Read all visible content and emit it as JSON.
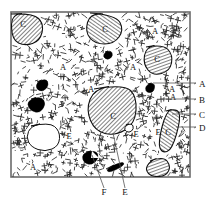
{
  "figure": {
    "kind": "petrographic-sketch",
    "frame": {
      "x": 11,
      "y": 12,
      "width": 179,
      "height": 165,
      "stroke": "#6b6b6b",
      "fill": "#ffffff"
    },
    "colors": {
      "ink": "#111111",
      "frame": "#6b6b6b",
      "hatch": "#1a1a1a",
      "opaque": "#000000",
      "matrix": "#2b2b2b",
      "leader": "#555555"
    }
  },
  "callouts": {
    "right": [
      {
        "key": "A",
        "label": "A",
        "x": 199,
        "y": 87,
        "line_from_x": 190,
        "line_to_x": 153,
        "line_y": 83
      },
      {
        "key": "B",
        "label": "B",
        "x": 199,
        "y": 103,
        "line_from_x": 190,
        "line_to_x": 160,
        "line_y": 99
      },
      {
        "key": "C",
        "label": "C",
        "x": 199,
        "y": 118,
        "line_from_x": 190,
        "line_to_x": 172,
        "line_y": 114
      },
      {
        "key": "D",
        "label": "D",
        "x": 199,
        "y": 131,
        "line_from_x": 190,
        "line_to_x": 176,
        "line_y": 127
      }
    ],
    "bottom": [
      {
        "key": "F",
        "label": "F",
        "x": 104,
        "y": 195,
        "line_from_x": 104,
        "line_from_y": 188,
        "line_to_x": 92,
        "line_to_y": 155
      },
      {
        "key": "E",
        "label": "E",
        "x": 125,
        "y": 195,
        "line_from_x": 125,
        "line_from_y": 188,
        "line_to_x": 113,
        "line_to_y": 133
      }
    ]
  },
  "in_figure_labels": [
    {
      "label": "C",
      "x": 23,
      "y": 27
    },
    {
      "label": "C",
      "x": 105,
      "y": 32
    },
    {
      "label": "A",
      "x": 155,
      "y": 34
    },
    {
      "label": "C",
      "x": 157,
      "y": 62
    },
    {
      "label": "A",
      "x": 63,
      "y": 70
    },
    {
      "label": "A",
      "x": 133,
      "y": 70
    },
    {
      "label": "A",
      "x": 91,
      "y": 92
    },
    {
      "label": "A",
      "x": 172,
      "y": 92
    },
    {
      "label": "A",
      "x": 173,
      "y": 100
    },
    {
      "label": "C",
      "x": 113,
      "y": 119
    },
    {
      "label": "E",
      "x": 69,
      "y": 139
    },
    {
      "label": "E",
      "x": 136,
      "y": 137
    },
    {
      "label": "E",
      "x": 158,
      "y": 135
    },
    {
      "label": "C",
      "x": 168,
      "y": 135
    },
    {
      "label": "A",
      "x": 33,
      "y": 170
    }
  ],
  "features": {
    "hatched_clasts": [
      {
        "name": "clast-top-left",
        "label": "C",
        "points": "11,14 33,13 44,24 40,41 25,46 12,40"
      },
      {
        "name": "clast-top-center",
        "label": "C",
        "points": "90,13 116,15 124,30 114,44 95,44 85,32"
      },
      {
        "name": "clast-upper-right",
        "label": "C",
        "points": "146,47 163,44 173,55 170,71 153,76 143,64"
      },
      {
        "name": "clast-center-large",
        "label": "C",
        "points": "94,89 124,84 137,97 135,124 115,136 95,131 86,110"
      },
      {
        "name": "clast-right-elong",
        "label": "C",
        "points": "166,111 177,108 181,118 172,150 162,153 158,143"
      },
      {
        "name": "clast-bottom-right",
        "label": "",
        "points": "150,161 163,156 171,166 166,176 152,177 145,170"
      }
    ],
    "opaque_grains": [
      {
        "name": "opaque-grain-1",
        "points": "105,52 111,50 113,56 108,60 103,57"
      },
      {
        "name": "opaque-grain-2",
        "points": "37,82 46,78 49,85 43,92 36,89"
      },
      {
        "name": "opaque-grain-3",
        "points": "31,99 41,96 46,104 40,113 31,111 27,104"
      },
      {
        "name": "opaque-grain-4",
        "points": "148,84 155,82 154,92 147,93 145,88"
      },
      {
        "name": "opaque-grain-5",
        "points": "86,152 96,150 99,158 92,165 84,163 82,156"
      },
      {
        "name": "opaque-bar",
        "points": "106,169 122,161 125,165 109,173"
      }
    ],
    "vesicles": [
      {
        "name": "vesicle-outlined",
        "label": "E",
        "points": "31,126 49,122 60,131 59,146 45,152 31,147 26,137"
      },
      {
        "name": "vesicle-small",
        "label": "",
        "points": "126,125 132,123 134,129 129,133 124,130"
      }
    ]
  }
}
